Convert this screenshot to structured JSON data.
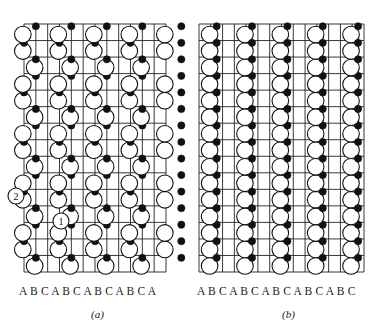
{
  "figure": {
    "panels": [
      {
        "id": "a",
        "caption": "(a)",
        "stacking_labels": "A B C A B C A B C A B C A",
        "grid": {
          "x0": 24,
          "x1": 166,
          "y0": 24,
          "y1": 272,
          "cols": 12,
          "rows": 15
        },
        "markers": [
          {
            "label": "2",
            "x": 16,
            "y": 196
          },
          {
            "label": "1",
            "x": 61,
            "y": 221
          }
        ]
      },
      {
        "id": "b",
        "caption": "(b)",
        "stacking_labels": "A B C A B C A B C A B C A B C",
        "grid": {
          "x0": 199,
          "x1": 364,
          "y0": 24,
          "y1": 272,
          "cols": 14,
          "rows": 15
        },
        "markers": []
      }
    ],
    "colors": {
      "line": "#222222",
      "open_atom_fill": "#ffffff",
      "filled_atom": "#111111"
    }
  }
}
